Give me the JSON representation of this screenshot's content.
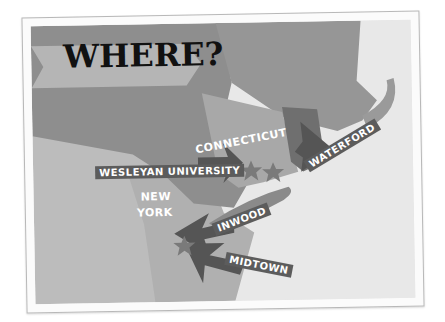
{
  "title": "WHERE?",
  "labels": {
    "connecticut": "CONNECTICUT",
    "waterford": "WATERFORD",
    "wesleyan": "WESLEYAN UNIVERSITY",
    "new_york_line1": "NEW",
    "new_york_line2": "YORK",
    "inwood": "INWOOD",
    "midtown": "MIDTOWN"
  },
  "colors": {
    "card_bg": "#fbfbfb",
    "ocean": "#e6e6e6",
    "ny": "#8f8f8f",
    "ct": "#a9a9a9",
    "ma": "#9a9a9a",
    "nj": "#b3b3b3",
    "pa": "#bdbdbd",
    "arrow": "#555555",
    "tag": "#5c5c5c"
  }
}
